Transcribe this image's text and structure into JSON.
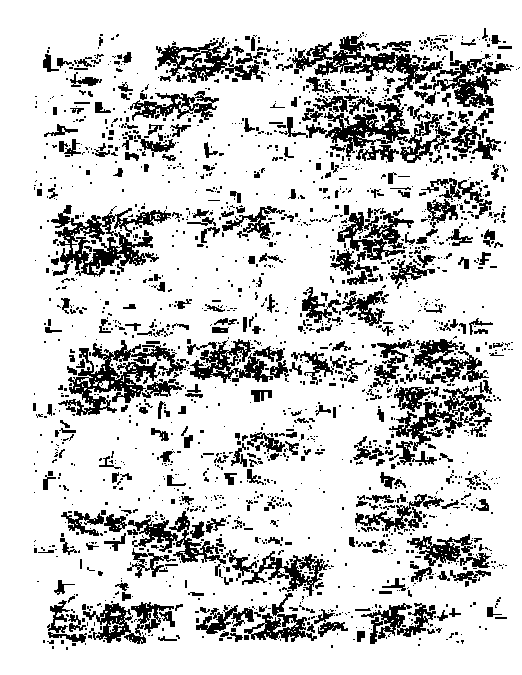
{
  "document": {
    "kind": "degraded-binarized-manuscript-scan",
    "script_style": "handwritten-cursive",
    "legibility": "illegible",
    "transcription": "",
    "page_width": 522,
    "page_height": 675,
    "background_color": "#ffffff",
    "ink_color": "#000000",
    "bit_depth": "1-bit (thresholded black and white)",
    "column_count": 1
  },
  "text_block": {
    "left": 32,
    "top": 38,
    "right": 492,
    "bottom": 648,
    "width": 460,
    "height": 610,
    "line_height": 21.8,
    "line_count": 28
  },
  "page_number": {
    "visible": true,
    "legible": false,
    "value": "",
    "x": 452,
    "y": 636
  },
  "noise": {
    "speckle_density": 0.055,
    "seed": 20250419,
    "min_blob_px": 1,
    "max_blob_px": 9
  },
  "lines": [
    {
      "index": 0,
      "y": 40,
      "ink": 0.3,
      "start": 0.14,
      "end": 0.99,
      "weight": 0.55
    },
    {
      "index": 1,
      "y": 62,
      "ink": 0.46,
      "start": 0.02,
      "end": 1.0,
      "weight": 0.8
    },
    {
      "index": 2,
      "y": 84,
      "ink": 0.4,
      "start": 0.0,
      "end": 0.98,
      "weight": 0.7
    },
    {
      "index": 3,
      "y": 106,
      "ink": 0.38,
      "start": 0.0,
      "end": 1.0,
      "weight": 0.66
    },
    {
      "index": 4,
      "y": 128,
      "ink": 0.42,
      "start": 0.02,
      "end": 1.0,
      "weight": 0.74
    },
    {
      "index": 5,
      "y": 150,
      "ink": 0.34,
      "start": 0.0,
      "end": 0.97,
      "weight": 0.6
    },
    {
      "index": 6,
      "y": 172,
      "ink": 0.36,
      "start": 0.04,
      "end": 1.0,
      "weight": 0.63
    },
    {
      "index": 7,
      "y": 194,
      "ink": 0.31,
      "start": 0.0,
      "end": 0.96,
      "weight": 0.56
    },
    {
      "index": 8,
      "y": 216,
      "ink": 0.39,
      "start": 0.0,
      "end": 1.0,
      "weight": 0.7
    },
    {
      "index": 9,
      "y": 238,
      "ink": 0.35,
      "start": 0.02,
      "end": 0.99,
      "weight": 0.62
    },
    {
      "index": 10,
      "y": 260,
      "ink": 0.33,
      "start": 0.0,
      "end": 1.0,
      "weight": 0.58
    },
    {
      "index": 11,
      "y": 282,
      "ink": 0.29,
      "start": 0.04,
      "end": 0.95,
      "weight": 0.52
    },
    {
      "index": 12,
      "y": 304,
      "ink": 0.37,
      "start": 0.0,
      "end": 1.0,
      "weight": 0.65
    },
    {
      "index": 13,
      "y": 326,
      "ink": 0.34,
      "start": 0.02,
      "end": 0.98,
      "weight": 0.6
    },
    {
      "index": 14,
      "y": 348,
      "ink": 0.44,
      "start": 0.0,
      "end": 1.0,
      "weight": 0.78
    },
    {
      "index": 15,
      "y": 370,
      "ink": 0.41,
      "start": 0.0,
      "end": 1.0,
      "weight": 0.72
    },
    {
      "index": 16,
      "y": 392,
      "ink": 0.36,
      "start": 0.02,
      "end": 0.99,
      "weight": 0.64
    },
    {
      "index": 17,
      "y": 414,
      "ink": 0.28,
      "start": 0.0,
      "end": 0.97,
      "weight": 0.5
    },
    {
      "index": 18,
      "y": 436,
      "ink": 0.33,
      "start": 0.0,
      "end": 1.0,
      "weight": 0.58
    },
    {
      "index": 19,
      "y": 458,
      "ink": 0.3,
      "start": 0.03,
      "end": 0.98,
      "weight": 0.54
    },
    {
      "index": 20,
      "y": 480,
      "ink": 0.35,
      "start": 0.0,
      "end": 1.0,
      "weight": 0.62
    },
    {
      "index": 21,
      "y": 502,
      "ink": 0.32,
      "start": 0.0,
      "end": 0.99,
      "weight": 0.57
    },
    {
      "index": 22,
      "y": 524,
      "ink": 0.37,
      "start": 0.02,
      "end": 1.0,
      "weight": 0.66
    },
    {
      "index": 23,
      "y": 546,
      "ink": 0.34,
      "start": 0.0,
      "end": 0.98,
      "weight": 0.6
    },
    {
      "index": 24,
      "y": 568,
      "ink": 0.38,
      "start": 0.0,
      "end": 1.0,
      "weight": 0.68
    },
    {
      "index": 25,
      "y": 590,
      "ink": 0.3,
      "start": 0.04,
      "end": 0.96,
      "weight": 0.53
    },
    {
      "index": 26,
      "y": 612,
      "ink": 0.45,
      "start": 0.0,
      "end": 1.0,
      "weight": 0.82
    },
    {
      "index": 27,
      "y": 634,
      "ink": 0.22,
      "start": 0.0,
      "end": 0.95,
      "weight": 0.4
    }
  ],
  "heavy_clusters": [
    {
      "x": 155,
      "y": 46,
      "w": 110,
      "h": 34,
      "density": 0.8
    },
    {
      "x": 290,
      "y": 42,
      "w": 120,
      "h": 30,
      "density": 0.72
    },
    {
      "x": 395,
      "y": 60,
      "w": 95,
      "h": 44,
      "density": 0.78
    },
    {
      "x": 120,
      "y": 92,
      "w": 90,
      "h": 28,
      "density": 0.62
    },
    {
      "x": 300,
      "y": 96,
      "w": 100,
      "h": 40,
      "density": 0.74
    },
    {
      "x": 410,
      "y": 110,
      "w": 80,
      "h": 48,
      "density": 0.7
    },
    {
      "x": 95,
      "y": 130,
      "w": 80,
      "h": 26,
      "density": 0.58
    },
    {
      "x": 330,
      "y": 126,
      "w": 75,
      "h": 34,
      "density": 0.66
    },
    {
      "x": 425,
      "y": 180,
      "w": 65,
      "h": 38,
      "density": 0.68
    },
    {
      "x": 50,
      "y": 214,
      "w": 95,
      "h": 44,
      "density": 0.76
    },
    {
      "x": 200,
      "y": 206,
      "w": 70,
      "h": 30,
      "density": 0.6
    },
    {
      "x": 335,
      "y": 210,
      "w": 60,
      "h": 44,
      "density": 0.7
    },
    {
      "x": 45,
      "y": 248,
      "w": 80,
      "h": 26,
      "density": 0.72
    },
    {
      "x": 330,
      "y": 250,
      "w": 90,
      "h": 30,
      "density": 0.58
    },
    {
      "x": 300,
      "y": 290,
      "w": 80,
      "h": 36,
      "density": 0.64
    },
    {
      "x": 65,
      "y": 348,
      "w": 110,
      "h": 40,
      "density": 0.78
    },
    {
      "x": 185,
      "y": 344,
      "w": 100,
      "h": 34,
      "density": 0.8
    },
    {
      "x": 290,
      "y": 352,
      "w": 60,
      "h": 32,
      "density": 0.62
    },
    {
      "x": 370,
      "y": 342,
      "w": 100,
      "h": 40,
      "density": 0.76
    },
    {
      "x": 390,
      "y": 390,
      "w": 90,
      "h": 46,
      "density": 0.74
    },
    {
      "x": 55,
      "y": 380,
      "w": 85,
      "h": 30,
      "density": 0.66
    },
    {
      "x": 235,
      "y": 432,
      "w": 70,
      "h": 26,
      "density": 0.58
    },
    {
      "x": 350,
      "y": 440,
      "w": 60,
      "h": 26,
      "density": 0.56
    },
    {
      "x": 60,
      "y": 510,
      "w": 100,
      "h": 24,
      "density": 0.7
    },
    {
      "x": 130,
      "y": 520,
      "w": 90,
      "h": 40,
      "density": 0.74
    },
    {
      "x": 355,
      "y": 494,
      "w": 70,
      "h": 36,
      "density": 0.64
    },
    {
      "x": 405,
      "y": 536,
      "w": 75,
      "h": 44,
      "density": 0.72
    },
    {
      "x": 225,
      "y": 556,
      "w": 95,
      "h": 26,
      "density": 0.66
    },
    {
      "x": 50,
      "y": 604,
      "w": 110,
      "h": 36,
      "density": 0.82
    },
    {
      "x": 195,
      "y": 606,
      "w": 130,
      "h": 32,
      "density": 0.74
    },
    {
      "x": 370,
      "y": 604,
      "w": 70,
      "h": 30,
      "density": 0.7
    }
  ]
}
